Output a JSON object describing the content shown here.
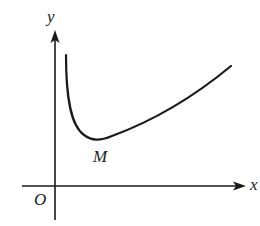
{
  "diagram": {
    "type": "function graph on coordinate axes",
    "labels": {
      "y_axis": "y",
      "x_axis": "x",
      "origin": "O",
      "min_point": "M"
    },
    "colors": {
      "stroke": "#1a1a1a",
      "background": "#ffffff"
    },
    "curve": {
      "description": "curve descending steeply near y-axis to a minimum point M, then rising gradually to the right"
    }
  }
}
